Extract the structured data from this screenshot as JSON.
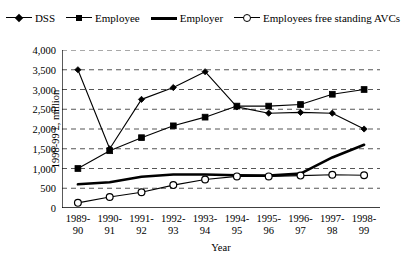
{
  "chart_data": {
    "type": "line",
    "title": "",
    "xlabel": "Year",
    "ylabel": "1998-99 £, million",
    "categories": [
      "1989-\n90",
      "1990-\n91",
      "1991-\n92",
      "1992-\n93",
      "1993-\n94",
      "1994-\n95",
      "1995-\n96",
      "1996-\n97",
      "1997-\n98",
      "1998-\n99"
    ],
    "category_lines": [
      [
        "1989-",
        "90"
      ],
      [
        "1990-",
        "91"
      ],
      [
        "1991-",
        "92"
      ],
      [
        "1992-",
        "93"
      ],
      [
        "1993-",
        "94"
      ],
      [
        "1994-",
        "95"
      ],
      [
        "1995-",
        "96"
      ],
      [
        "1996-",
        "97"
      ],
      [
        "1997-",
        "98"
      ],
      [
        "1998-",
        "99"
      ]
    ],
    "ylim": [
      0,
      4000
    ],
    "yticks": [
      0,
      500,
      1000,
      1500,
      2000,
      2500,
      3000,
      3500,
      4000
    ],
    "ytick_labels": [
      "0",
      "500",
      "1,000",
      "1,500",
      "2,000",
      "2,500",
      "3,000",
      "3,500",
      "4,000"
    ],
    "grid": true,
    "grid_style": "dashed-horizontal",
    "legend_position": "top-center",
    "series": [
      {
        "name": "DSS",
        "marker": "diamond",
        "values": [
          3500,
          1500,
          2750,
          3050,
          3450,
          2560,
          2400,
          2420,
          2400,
          2000
        ]
      },
      {
        "name": "Employee",
        "marker": "square",
        "values": [
          1000,
          1450,
          1780,
          2080,
          2300,
          2580,
          2580,
          2620,
          2880,
          3000
        ]
      },
      {
        "name": "Employer",
        "marker": "none",
        "values": [
          600,
          650,
          790,
          850,
          850,
          830,
          820,
          870,
          1280,
          1600
        ]
      },
      {
        "name": "Employees free standing AVCs",
        "marker": "circle",
        "values": [
          130,
          280,
          400,
          580,
          720,
          800,
          800,
          820,
          840,
          830
        ]
      }
    ]
  },
  "legend": {
    "items": [
      {
        "label": "DSS",
        "symbol": "diamond-marker-line"
      },
      {
        "label": "Employee",
        "symbol": "square-marker-line"
      },
      {
        "label": "Employer",
        "symbol": "thick-line"
      },
      {
        "label": "Employees free standing AVCs",
        "symbol": "open-circle-marker-line"
      }
    ]
  },
  "colors": {
    "series": "#000000",
    "grid": "#555555",
    "axis": "#000000",
    "background": "#ffffff"
  }
}
